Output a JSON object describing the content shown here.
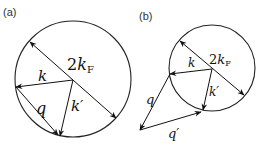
{
  "panels": [
    {
      "label": "(a)",
      "circle": {
        "cx": 73,
        "cy": 79,
        "r": 58
      },
      "labels": {
        "diameter": {
          "main": "2",
          "k": "k",
          "sub": "F"
        },
        "k": "k",
        "k_prime": "k′",
        "q": "q"
      }
    },
    {
      "label": "(b)",
      "circle": {
        "cx": 212,
        "cy": 68,
        "r": 43
      },
      "labels": {
        "diameter": {
          "main": "2",
          "k": "k",
          "sub": "F"
        },
        "k": "k",
        "k_prime": "k′",
        "q": "q",
        "q_prime": "q′"
      }
    }
  ],
  "colors": {
    "stroke": "#111111",
    "background": "#ffffff"
  }
}
